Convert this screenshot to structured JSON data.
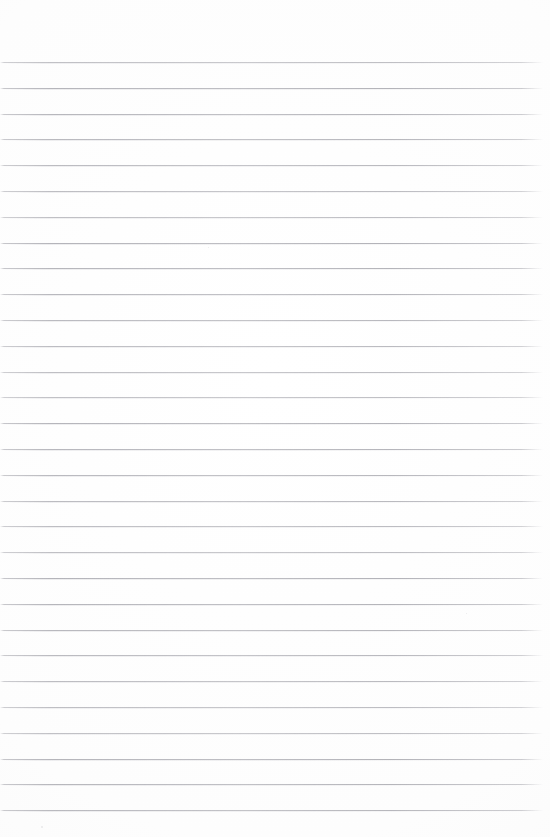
{
  "document": {
    "kind": "lined-paper-scan",
    "title": "",
    "body_text": "",
    "background_color": "#fdfdfd",
    "rule_color": "#9696a0",
    "page": {
      "width": 550,
      "height": 837
    },
    "ruling": {
      "line_count": 30,
      "first_line_y": 62,
      "line_spacing": 25.8,
      "line_thickness": 1,
      "left_margin_x": 0,
      "right_end_x": 543,
      "top_margin": 62,
      "bottom_margin": 27,
      "has_vertical_margin_rule": false,
      "has_holes": false,
      "has_header": false,
      "has_page_number": false
    },
    "content_summary": "Blank ruled notebook page; no handwriting, printed text, headings, or page numbers are present.",
    "artifacts": [
      {
        "name": "scan-speck",
        "x": 41,
        "y": 826,
        "size": 2
      },
      {
        "name": "scan-speck",
        "x": 208,
        "y": 247,
        "size": 1
      },
      {
        "name": "scan-speck",
        "x": 466,
        "y": 613,
        "size": 1
      }
    ]
  }
}
